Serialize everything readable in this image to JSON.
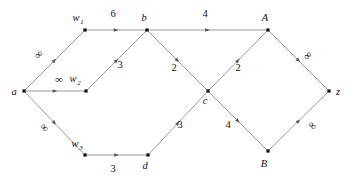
{
  "figure": {
    "kind": "weighted-network-diagram",
    "background_color": "#ffffff",
    "edge_color": "#8c8c90",
    "node_color": "#111114",
    "label_color": "#111114"
  },
  "nodes": [
    {
      "id": "a",
      "label": "a",
      "sub": "",
      "x": 24,
      "y": 91,
      "label_x": 14,
      "label_y": 95,
      "italic": true
    },
    {
      "id": "w1",
      "label": "w",
      "sub": "1",
      "x": 85,
      "y": 30,
      "label_x": 76,
      "label_y": 21,
      "italic": true
    },
    {
      "id": "w2",
      "label": "w",
      "sub": "2",
      "x": 86,
      "y": 91,
      "label_x": 73,
      "label_y": 82,
      "italic": true
    },
    {
      "id": "w3",
      "label": "w",
      "sub": "3",
      "x": 85,
      "y": 155,
      "label_x": 75,
      "label_y": 147,
      "italic": true
    },
    {
      "id": "b",
      "label": "b",
      "sub": "",
      "x": 147,
      "y": 30,
      "label_x": 144,
      "label_y": 21,
      "italic": true
    },
    {
      "id": "d",
      "label": "d",
      "sub": "",
      "x": 148,
      "y": 155,
      "label_x": 145,
      "label_y": 169,
      "italic": true
    },
    {
      "id": "c",
      "label": "c",
      "sub": "",
      "x": 208,
      "y": 91,
      "label_x": 205,
      "label_y": 104,
      "italic": true
    },
    {
      "id": "A",
      "label": "A",
      "sub": "",
      "x": 268,
      "y": 30,
      "label_x": 265,
      "label_y": 21,
      "italic": true
    },
    {
      "id": "B",
      "label": "B",
      "sub": "",
      "x": 268,
      "y": 151,
      "label_x": 264,
      "label_y": 167,
      "italic": true
    },
    {
      "id": "z",
      "label": "z",
      "sub": "",
      "x": 329,
      "y": 91,
      "label_x": 338,
      "label_y": 95,
      "italic": true
    }
  ],
  "edges": [
    {
      "id": "a-w1",
      "from": "a",
      "to": "w1",
      "weight": "∞",
      "is_infinity": true,
      "label_x": 41,
      "label_y": 57,
      "rotate": -45
    },
    {
      "id": "a-w2",
      "from": "a",
      "to": "w2",
      "weight": "∞",
      "is_infinity": true,
      "label_x": 59,
      "label_y": 83,
      "rotate": 0
    },
    {
      "id": "a-w3",
      "from": "a",
      "to": "w3",
      "weight": "∞",
      "is_infinity": true,
      "label_x": 42,
      "label_y": 130,
      "rotate": 45
    },
    {
      "id": "w1-b",
      "from": "w1",
      "to": "b",
      "weight": "6",
      "is_infinity": false,
      "label_x": 113,
      "label_y": 17,
      "rotate": 0
    },
    {
      "id": "w2-b",
      "from": "w2",
      "to": "b",
      "weight": "3",
      "is_infinity": false,
      "label_x": 120,
      "label_y": 68,
      "rotate": 0
    },
    {
      "id": "w3-d",
      "from": "w3",
      "to": "d",
      "weight": "3",
      "is_infinity": false,
      "label_x": 113,
      "label_y": 172,
      "rotate": 0
    },
    {
      "id": "b-A",
      "from": "b",
      "to": "A",
      "weight": "4",
      "is_infinity": false,
      "label_x": 205,
      "label_y": 17,
      "rotate": 0
    },
    {
      "id": "b-c",
      "from": "b",
      "to": "c",
      "weight": "2",
      "is_infinity": false,
      "label_x": 174,
      "label_y": 71,
      "rotate": 0
    },
    {
      "id": "d-c",
      "from": "d",
      "to": "c",
      "weight": "3",
      "is_infinity": false,
      "label_x": 180,
      "label_y": 128,
      "rotate": 0
    },
    {
      "id": "c-A",
      "from": "c",
      "to": "A",
      "weight": "2",
      "is_infinity": false,
      "label_x": 238,
      "label_y": 71,
      "rotate": 0
    },
    {
      "id": "c-B",
      "from": "c",
      "to": "B",
      "weight": "4",
      "is_infinity": false,
      "label_x": 228,
      "label_y": 128,
      "rotate": 0
    },
    {
      "id": "A-z",
      "from": "A",
      "to": "z",
      "weight": "∞",
      "is_infinity": true,
      "label_x": 310,
      "label_y": 58,
      "rotate": -45
    },
    {
      "id": "B-z",
      "from": "B",
      "to": "z",
      "weight": "∞",
      "is_infinity": true,
      "label_x": 310,
      "label_y": 128,
      "rotate": 45
    }
  ]
}
